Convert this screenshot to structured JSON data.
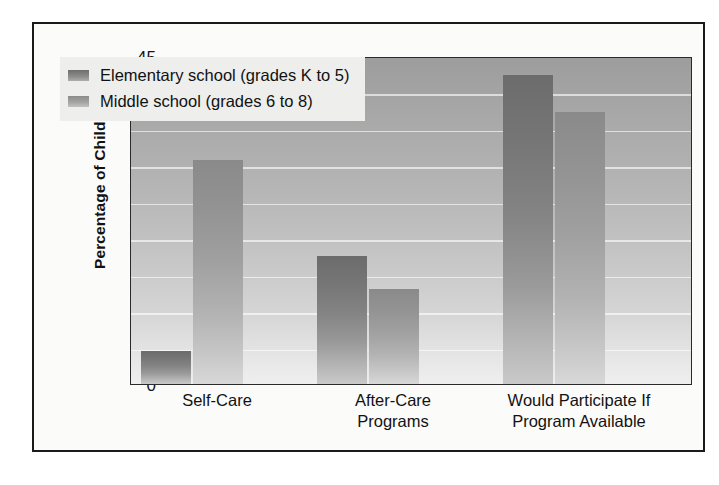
{
  "chart_data": {
    "type": "bar",
    "title": "",
    "xlabel": "",
    "ylabel": "Percentage of Children",
    "ylim": [
      0,
      45
    ],
    "ytick_step": 5,
    "yticks": [
      "45",
      "40",
      "35",
      "30",
      "25",
      "20",
      "15",
      "10",
      "5",
      "0"
    ],
    "grid": true,
    "legend_position": "top-left",
    "categories": [
      "Self-Care",
      "After-Care\nPrograms",
      "Would Participate If\nProgram Available"
    ],
    "category_lines": [
      [
        "Self-Care"
      ],
      [
        "After-Care",
        "Programs"
      ],
      [
        "Would Participate If",
        "Program Available"
      ]
    ],
    "series": [
      {
        "name": "Elementary school (grades K to 5)",
        "values": [
          4.5,
          17.6,
          42.4
        ],
        "color": "#7a7a7a"
      },
      {
        "name": "Middle school (grades 6 to 8)",
        "values": [
          30.7,
          13.0,
          37.3
        ],
        "color": "#9b9b9b"
      }
    ]
  },
  "figure": {
    "border_color": "#1a1a1a",
    "plot_background": "#b4b4b4",
    "gridline_color": "#ffffff",
    "legend_background": "#eeeeec"
  }
}
